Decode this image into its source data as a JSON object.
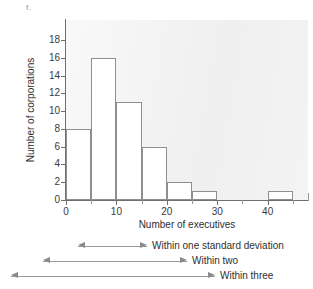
{
  "figure": {
    "label": "f."
  },
  "chart_data": {
    "type": "bar",
    "title": "",
    "xlabel": "Number of executives",
    "ylabel": "Number of corporations",
    "xlim": [
      0,
      48
    ],
    "ylim": [
      0,
      19
    ],
    "grid": false,
    "legend": "none",
    "bin_width": 5,
    "x_ticks": [
      0,
      10,
      20,
      30,
      40
    ],
    "x_ticks_minor": [
      5,
      15,
      25,
      35,
      45
    ],
    "y_ticks": [
      0,
      2,
      4,
      6,
      8,
      10,
      12,
      14,
      16,
      18
    ],
    "bins": [
      {
        "start": 0,
        "end": 5,
        "value": 8
      },
      {
        "start": 5,
        "end": 10,
        "value": 16
      },
      {
        "start": 10,
        "end": 15,
        "value": 11
      },
      {
        "start": 15,
        "end": 20,
        "value": 6
      },
      {
        "start": 20,
        "end": 25,
        "value": 2
      },
      {
        "start": 25,
        "end": 30,
        "value": 1
      },
      {
        "start": 30,
        "end": 35,
        "value": 0
      },
      {
        "start": 35,
        "end": 40,
        "value": 0
      },
      {
        "start": 40,
        "end": 45,
        "value": 1
      }
    ],
    "categories": [
      "0-5",
      "5-10",
      "10-15",
      "15-20",
      "20-25",
      "25-30",
      "30-35",
      "35-40",
      "40-45"
    ],
    "values": [
      8,
      16,
      11,
      6,
      2,
      1,
      0,
      0,
      1
    ],
    "annotations": [
      {
        "label": "Within one standard deviation",
        "x_left": 78,
        "x_right": 147
      },
      {
        "label": "Within two",
        "x_left": 43,
        "x_right": 187
      },
      {
        "label": "Within three",
        "x_left": 11,
        "x_right": 215
      }
    ]
  },
  "colors": {
    "plot_background": "#f1f1f1",
    "bar_fill": "#ffffff",
    "bar_stroke": "#8f8f8f",
    "axis": "#6f6f6f",
    "text": "#2f2f2f",
    "arrow": "#8a8a8a"
  }
}
